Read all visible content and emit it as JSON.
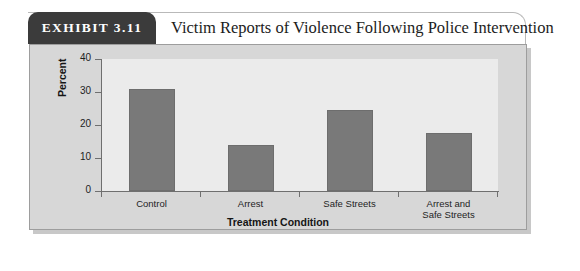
{
  "exhibit": {
    "tab_label": "EXHIBIT 3.11",
    "title": "Victim Reports of Violence Following Police Intervention"
  },
  "colors": {
    "tab_background": "#3b3b3b",
    "tab_text": "#ffffff",
    "panel_background": "#d7d7d7",
    "plot_background": "#ebebeb",
    "bar_fill": "#797979",
    "axis": "#6f6f6f"
  },
  "chart_data": {
    "type": "bar",
    "title": "Victim Reports of Violence Following Police Intervention",
    "categories": [
      "Control",
      "Arrest",
      "Safe Streets",
      "Arrest and Safe Streets"
    ],
    "category_lines": [
      [
        "Control"
      ],
      [
        "Arrest"
      ],
      [
        "Safe Streets"
      ],
      [
        "Arrest and",
        "Safe Streets"
      ]
    ],
    "values": [
      31,
      14,
      24.5,
      17.7
    ],
    "xlabel": "Treatment Condition",
    "ylabel": "Percent",
    "ylim": [
      0,
      40
    ],
    "yticks": [
      0,
      10,
      20,
      30,
      40
    ],
    "ytick_labels": [
      "0",
      "10",
      "20",
      "30",
      "40"
    ],
    "grid": false,
    "legend": false
  }
}
